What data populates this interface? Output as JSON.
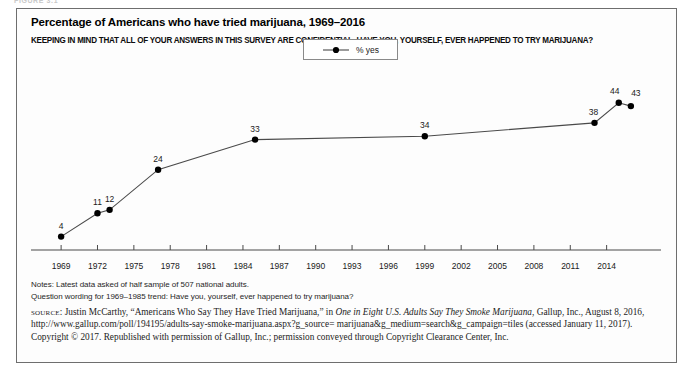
{
  "figure_tag": "FIGURE 3.1",
  "panel": {
    "title": "Percentage of Americans who have tried marijuana, 1969–2016",
    "question": "KEEPING IN MIND THAT ALL OF YOUR ANSWERS IN THIS SURVEY ARE CONFIDENTIAL, HAVE YOU, YOURSELF, EVER HAPPENED TO TRY MARIJUANA?"
  },
  "legend": {
    "label": "% yes"
  },
  "notes": [
    "Notes: Latest data asked of half sample of 507 national adults.",
    "Question wording for 1969–1985 trend: Have you, yourself, ever happened to try marijuana?"
  ],
  "source": {
    "label": "source",
    "part1": ": Justin McCarthy, “Americans Who Say They Have Tried Marijuana,” in ",
    "italic_title": "One in Eight U.S. Adults Say They Smoke Marijuana",
    "part2": ", Gallup, Inc., August 8, 2016, http://www.gallup.com/poll/194195/adults-say-smoke-marijuana.aspx?g_source= marijuana&g_medium=search&g_campaign=tiles (accessed January 11, 2017). Copyright © 2017. Republished with permission of Gallup, Inc.; permission conveyed through Copyright Clearance Center, Inc."
  },
  "colors": {
    "line": "#4a4a4a",
    "marker": "#000000",
    "axis": "#4a4a4a",
    "panel_border": "#6e6e6e",
    "background": "#fdfdfd"
  },
  "chart_data": {
    "type": "line",
    "title": "Percentage of Americans who have tried marijuana, 1969–2016",
    "subtitle": "KEEPING IN MIND THAT ALL OF YOUR ANSWERS IN THIS SURVEY ARE CONFIDENTIAL, HAVE YOU, YOURSELF, EVER HAPPENED TO TRY MARIJUANA?",
    "xlabel": "",
    "ylabel": "",
    "xlim": [
      1968,
      2017
    ],
    "ylim": [
      0,
      52
    ],
    "grid": false,
    "legend_position": "top-center",
    "series": [
      {
        "name": "% yes",
        "x": [
          1969,
          1972,
          1973,
          1977,
          1985,
          1999,
          2013,
          2015,
          2016
        ],
        "values": [
          4,
          11,
          12,
          24,
          33,
          34,
          38,
          44,
          43
        ]
      }
    ],
    "point_labels": [
      "4",
      "11",
      "12",
      "24",
      "33",
      "34",
      "38",
      "44",
      "43"
    ],
    "xticks": [
      1969,
      1972,
      1975,
      1978,
      1981,
      1984,
      1987,
      1990,
      1993,
      1996,
      1999,
      2002,
      2005,
      2008,
      2011,
      2014
    ],
    "xtick_labels": [
      "1969",
      "1972",
      "1975",
      "1978",
      "1981",
      "1984",
      "1987",
      "1990",
      "1993",
      "1996",
      "1999",
      "2002",
      "2005",
      "2008",
      "2011",
      "2014"
    ],
    "yticks": [],
    "ytick_labels": []
  }
}
